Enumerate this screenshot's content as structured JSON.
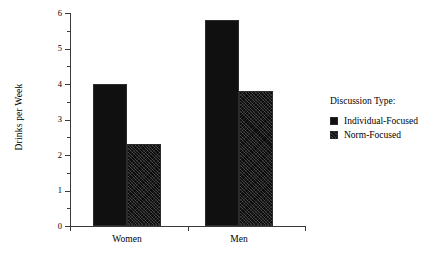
{
  "chart_data": {
    "type": "bar",
    "title": "",
    "xlabel": "",
    "ylabel": "Drinks per Week",
    "categories": [
      "Women",
      "Men"
    ],
    "series": [
      {
        "name": "Individual-Focused",
        "values": [
          4.0,
          5.8
        ],
        "fill": "solid",
        "color": "#101010"
      },
      {
        "name": "Norm-Focused",
        "values": [
          2.3,
          3.8
        ],
        "fill": "hatched",
        "color": "#0d0d0d"
      }
    ],
    "ylim": [
      0,
      6
    ],
    "ytick_labels": [
      "0",
      "1",
      "2",
      "3",
      "4",
      "5",
      "6"
    ],
    "ytick_values": [
      0,
      1,
      2,
      3,
      4,
      5,
      6
    ],
    "yminor_values": [
      0.5,
      1.5,
      2.5,
      3.5,
      4.5,
      5.5
    ],
    "grid": false,
    "legend_position": "right",
    "legend_title": "Discussion Type:",
    "background": "#ffffff",
    "axis_color": "#3a3a3a"
  },
  "legend": {
    "title": "Discussion Type:",
    "entries": [
      {
        "label": "Individual-Focused",
        "swatch": "solid-black-square"
      },
      {
        "label": "Norm-Focused",
        "swatch": "hatched-black-square"
      }
    ]
  },
  "axes": {
    "y_label": "Drinks per Week",
    "y_ticks": [
      "6",
      "5",
      "4",
      "3",
      "2",
      "1",
      "0"
    ],
    "x_ticks": [
      "Women",
      "Men"
    ]
  }
}
